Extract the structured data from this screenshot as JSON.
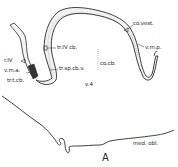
{
  "figure": {
    "panel_label": "A",
    "labels": {
      "r_iv": "r.IV",
      "v_m_a": "v.m.a.",
      "tr_t_cb": "tr.t.cb.",
      "tr_iv_cb": "tr.IV cb.",
      "tr_sp_cb_v": "tr.sp.cb.v.",
      "co_cb": "co.cb.",
      "v4": "v.4",
      "co_vest": "co.vest.",
      "v_m_p": "v.m.p.",
      "med_obl": "med. obl."
    },
    "colors": {
      "ink": "#2a2a2a",
      "fill": "#f2f2f2",
      "dark_band": "#333333"
    }
  }
}
